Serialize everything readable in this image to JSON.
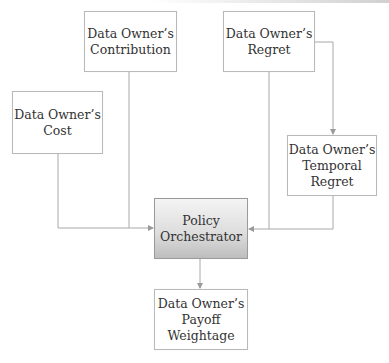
{
  "diagram": {
    "title": "",
    "nodes": {
      "contribution": {
        "label": "Data Owner’s\nContribution"
      },
      "regret": {
        "label": "Data Owner’s\nRegret"
      },
      "cost": {
        "label": "Data Owner’s\nCost"
      },
      "temporal_regret": {
        "label": "Data Owner’s\nTemporal\nRegret"
      },
      "policy": {
        "label": "Policy\nOrchestrator"
      },
      "payoff": {
        "label": "Data Owner’s\nPayoff\nWeightage"
      }
    },
    "edges": [
      {
        "from": "cost",
        "to": "policy"
      },
      {
        "from": "contribution",
        "to": "policy"
      },
      {
        "from": "regret",
        "to": "temporal_regret"
      },
      {
        "from": "regret",
        "to": "policy"
      },
      {
        "from": "temporal_regret",
        "to": "policy"
      },
      {
        "from": "policy",
        "to": "payoff"
      }
    ],
    "colors": {
      "line": "#a0a0a0",
      "border": "#b9b9b9",
      "central_fill_top": "#f4f4f4",
      "central_fill_bottom": "#bdbdbd"
    }
  }
}
